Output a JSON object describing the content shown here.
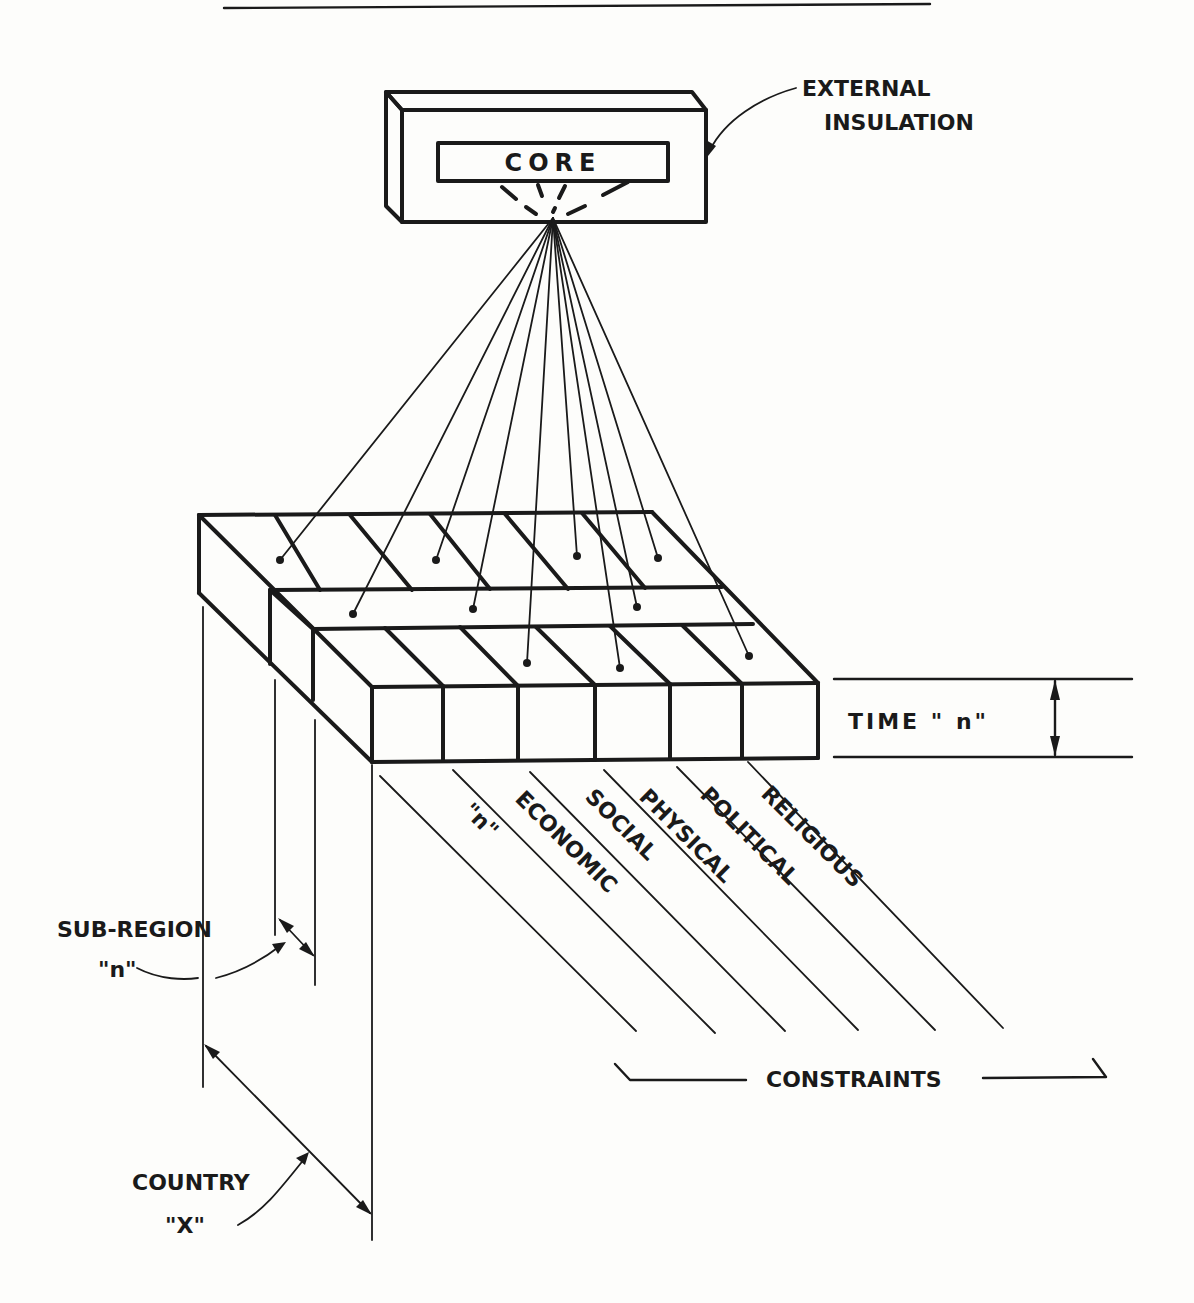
{
  "diagram": {
    "core": {
      "label": "CORE"
    },
    "insulation": {
      "line1": "EXTERNAL",
      "line2": "INSULATION"
    },
    "time": {
      "label": "TIME \" n\""
    },
    "constraints": {
      "items": [
        "\"n\"",
        "ECONOMIC",
        "SOCIAL",
        "PHYSICAL",
        "POLITICAL",
        "RELIGIOUS"
      ],
      "group_label": "CONSTRAINTS"
    },
    "subregion": {
      "line1": "SUB-REGION",
      "line2": "\"n\""
    },
    "country": {
      "line1": "COUNTRY",
      "line2": "\"X\""
    }
  }
}
